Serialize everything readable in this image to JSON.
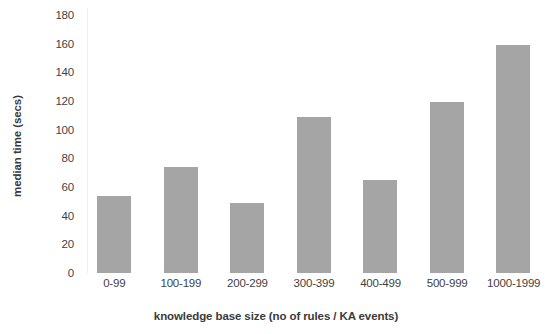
{
  "chart_data": {
    "type": "bar",
    "title": "",
    "xlabel": "knowledge base size (no of rules / KA events)",
    "ylabel": "median time (secs)",
    "categories": [
      "0-99",
      "100-199",
      "200-299",
      "300-399",
      "400-499",
      "500-999",
      "1000-1999"
    ],
    "values": [
      54,
      74,
      49,
      109,
      65,
      119,
      159
    ],
    "series": [
      {
        "name": "median time",
        "values": [
          54,
          74,
          49,
          109,
          65,
          119,
          159
        ]
      }
    ],
    "ylim": [
      0,
      180
    ],
    "yticks": [
      0,
      20,
      40,
      60,
      80,
      100,
      120,
      140,
      160,
      180
    ],
    "ytick_labels": [
      "0",
      "20",
      "40",
      "60",
      "80",
      "100",
      "120",
      "140",
      "160",
      "180"
    ],
    "grid": false,
    "legend": false,
    "bar_color": "#a5a5a5",
    "text_color": "#3f3f3f",
    "background_color": "#ffffff"
  }
}
